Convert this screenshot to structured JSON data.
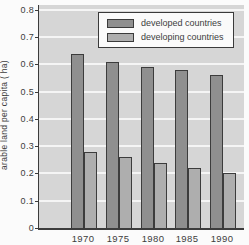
{
  "chart_data": {
    "type": "bar",
    "title": "",
    "xlabel": "",
    "ylabel": "arable land per capita ( ha)",
    "ylim": [
      0,
      0.8
    ],
    "yticks": [
      0,
      0.1,
      0.2,
      0.3,
      0.4,
      0.5,
      0.6,
      0.7,
      0.8
    ],
    "ytick_labels": [
      "0",
      "0.1",
      "0.2",
      "0.3",
      "0.4",
      "0.5",
      "0.6",
      "0.7",
      "0.8"
    ],
    "grid": true,
    "legend_position": "top-right",
    "categories": [
      "1970",
      "1975",
      "1980",
      "1985",
      "1990"
    ],
    "series": [
      {
        "name": "developed countries",
        "color": "#8f8f8f",
        "values": [
          0.64,
          0.61,
          0.59,
          0.58,
          0.56
        ]
      },
      {
        "name": "developing countries",
        "color": "#aeaeae",
        "values": [
          0.28,
          0.26,
          0.24,
          0.22,
          0.2
        ]
      }
    ]
  },
  "colors": {
    "plot_background": "#d6d6d6",
    "gridline": "#f5f5f5",
    "axis": "#3c3c3c",
    "text": "#3d3d3d",
    "bar_border": "#3c3c3c",
    "legend_background": "#fafafa",
    "legend_border": "#3a3a3a"
  }
}
